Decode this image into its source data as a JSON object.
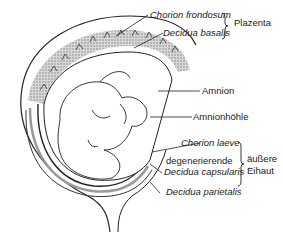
{
  "diagram": {
    "labels": {
      "chorion_frondosum": "Chorion frondosum",
      "decidua_basalis": "Decidua basalis",
      "plazenta": "Plazenta",
      "amnion": "Amnion",
      "amnionhoehle": "Amnionhöhle",
      "chorion_laeve": "Chorion laeve",
      "degenerierende": "degenerierende",
      "decidua_capsularis": "Decidua capsularis",
      "decidua_parietalis": "Decidua parietalis",
      "aeussere": "äußere",
      "eihaut": "Eihaut"
    },
    "groups": [
      {
        "name": "Plazenta",
        "members": [
          "Chorion frondosum",
          "Decidua basalis"
        ]
      },
      {
        "name": "äußere Eihaut",
        "members": [
          "Chorion laeve",
          "degenerierende Decidua capsularis",
          "Decidua parietalis"
        ]
      }
    ],
    "colors": {
      "line": "#222222",
      "stipple": "#9a9a9a",
      "background": "#ffffff"
    }
  }
}
